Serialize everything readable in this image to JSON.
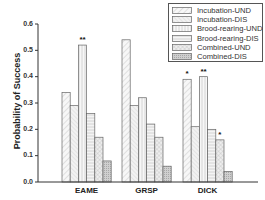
{
  "chart_data": {
    "type": "bar",
    "title": "",
    "xlabel": "",
    "ylabel": "Probability of Success",
    "ylim": [
      0.0,
      0.6
    ],
    "yticks": [
      "0.0",
      "0.1",
      "0.2",
      "0.3",
      "0.4",
      "0.5",
      "0.6"
    ],
    "grid": false,
    "legend_position": "top-right",
    "categories": [
      "EAME",
      "GRSP",
      "DICK"
    ],
    "series": [
      {
        "name": "Incubation-UND",
        "values": [
          0.34,
          0.54,
          0.39
        ],
        "significance": [
          "",
          "",
          "*"
        ],
        "pattern": "diag-light",
        "color": "#f2f2f2"
      },
      {
        "name": "Incubation-DIS",
        "values": [
          0.29,
          0.29,
          0.21
        ],
        "significance": [
          "",
          "",
          ""
        ],
        "pattern": "diag-fine",
        "color": "#ececec"
      },
      {
        "name": "Brood-rearing-UND",
        "values": [
          0.52,
          0.32,
          0.4
        ],
        "significance": [
          "**",
          "",
          "**"
        ],
        "pattern": "vertical",
        "color": "#f4f4f4"
      },
      {
        "name": "Brood-rearing-DIS",
        "values": [
          0.26,
          0.22,
          0.2
        ],
        "significance": [
          "",
          "",
          ""
        ],
        "pattern": "horizontal",
        "color": "#ededed"
      },
      {
        "name": "Combined-UND",
        "values": [
          0.17,
          0.17,
          0.16
        ],
        "significance": [
          "",
          "",
          "*"
        ],
        "pattern": "crosshatch",
        "color": "#e6e6e6"
      },
      {
        "name": "Combined-DIS",
        "values": [
          0.08,
          0.06,
          0.04
        ],
        "significance": [
          "",
          "",
          ""
        ],
        "pattern": "dense",
        "color": "#c8c8c8"
      }
    ]
  }
}
